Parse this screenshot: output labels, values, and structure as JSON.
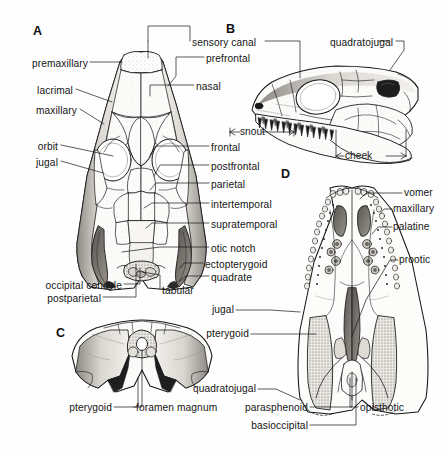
{
  "figure": {
    "background_color": "#fefefe",
    "ink_color": "#151515",
    "width": 447,
    "height": 452
  },
  "panels": [
    {
      "id": "A",
      "label": "A",
      "view": "dorsal",
      "x": 33,
      "y": 24
    },
    {
      "id": "B",
      "label": "B",
      "view": "lateral",
      "x": 226,
      "y": 22
    },
    {
      "id": "C",
      "label": "C",
      "view": "occipital",
      "x": 56,
      "y": 326
    },
    {
      "id": "D",
      "label": "D",
      "view": "palatal",
      "x": 281,
      "y": 167
    }
  ],
  "labels_left_A": [
    {
      "text": "premaxillary",
      "x": 88,
      "y": 65,
      "align": "right"
    },
    {
      "text": "lacrimal",
      "x": 73,
      "y": 92,
      "align": "right"
    },
    {
      "text": "maxillary",
      "x": 77,
      "y": 112,
      "align": "right"
    },
    {
      "text": "orbit",
      "x": 58,
      "y": 148,
      "align": "right"
    },
    {
      "text": "jugal",
      "x": 58,
      "y": 164,
      "align": "right"
    },
    {
      "text": "occipital condyle",
      "x": 122,
      "y": 287,
      "align": "right"
    },
    {
      "text": "postparietal",
      "x": 101,
      "y": 300,
      "align": "right"
    }
  ],
  "labels_center_top": [
    {
      "text": "sensory canal",
      "x": 192,
      "y": 44,
      "align": "left"
    },
    {
      "text": "prefrontal",
      "x": 206,
      "y": 60,
      "align": "left"
    },
    {
      "text": "nasal",
      "x": 196,
      "y": 88,
      "align": "left"
    },
    {
      "text": "quadratojugal",
      "x": 330,
      "y": 44,
      "align": "left"
    }
  ],
  "labels_right_A": [
    {
      "text": "frontal",
      "x": 211,
      "y": 149,
      "align": "left"
    },
    {
      "text": "postfrontal",
      "x": 211,
      "y": 168,
      "align": "left"
    },
    {
      "text": "parietal",
      "x": 211,
      "y": 186,
      "align": "left"
    },
    {
      "text": "intertemporal",
      "x": 211,
      "y": 206,
      "align": "left"
    },
    {
      "text": "supratemporal",
      "x": 211,
      "y": 226,
      "align": "left"
    },
    {
      "text": "otic notch",
      "x": 211,
      "y": 250,
      "align": "left"
    },
    {
      "text": "ectopterygoid",
      "x": 205,
      "y": 266,
      "align": "left"
    },
    {
      "text": "quadrate",
      "x": 211,
      "y": 279,
      "align": "left"
    },
    {
      "text": "tabular",
      "x": 162,
      "y": 292,
      "align": "left"
    }
  ],
  "labels_B_dimensions": [
    {
      "text": "snout",
      "x": 248,
      "y": 132
    },
    {
      "text": "cheek",
      "x": 354,
      "y": 153
    }
  ],
  "labels_D_right": [
    {
      "text": "vomer",
      "x": 404,
      "y": 196,
      "align": "left"
    },
    {
      "text": "maxillary",
      "x": 394,
      "y": 212,
      "align": "left"
    },
    {
      "text": "palatine",
      "x": 394,
      "y": 230,
      "align": "left"
    },
    {
      "text": "prootic",
      "x": 400,
      "y": 263,
      "align": "left"
    }
  ],
  "labels_D_left": [
    {
      "text": "jugal",
      "x": 234,
      "y": 313,
      "align": "right"
    },
    {
      "text": "pterygoid",
      "x": 249,
      "y": 337,
      "align": "right"
    },
    {
      "text": "quadratojugal",
      "x": 256,
      "y": 392,
      "align": "right"
    }
  ],
  "labels_D_bottom": [
    {
      "text": "parasphenoid",
      "x": 308,
      "y": 410,
      "align": "right"
    },
    {
      "text": "opisthotic",
      "x": 360,
      "y": 410,
      "align": "left"
    },
    {
      "text": "basioccipital",
      "x": 308,
      "y": 428,
      "align": "right"
    }
  ],
  "labels_C": [
    {
      "text": "pterygoid",
      "x": 112,
      "y": 410,
      "align": "right"
    },
    {
      "text": "foramen magnum",
      "x": 136,
      "y": 410,
      "align": "left"
    }
  ],
  "bones_depicted": [
    "premaxillary",
    "nasal",
    "lacrimal",
    "maxillary",
    "prefrontal",
    "frontal",
    "postfrontal",
    "parietal",
    "intertemporal",
    "supratemporal",
    "tabular",
    "postparietal",
    "jugal",
    "quadratojugal",
    "quadrate",
    "ectopterygoid",
    "palatine",
    "vomer",
    "pterygoid",
    "parasphenoid",
    "basioccipital",
    "opisthotic",
    "prootic"
  ],
  "features_depicted": [
    "sensory canal",
    "orbit",
    "otic notch",
    "occipital condyle",
    "foramen magnum",
    "snout",
    "cheek"
  ]
}
